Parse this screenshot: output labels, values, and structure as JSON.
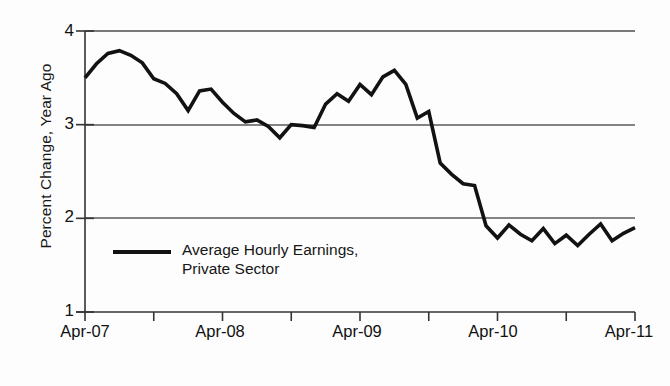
{
  "chart_data": {
    "type": "line",
    "title": "",
    "subtitle": "",
    "xlabel": "",
    "ylabel": "Percent Change, Year Ago",
    "ylim": [
      1,
      4
    ],
    "yticks": [
      1,
      2,
      3,
      4
    ],
    "ytick_labels": [
      "1",
      "2",
      "3",
      "4"
    ],
    "grid": "horizontal gridlines at 2, 3, and 4; baseline axis at 1",
    "gridlines_at": [
      2,
      3,
      4
    ],
    "xtick_labels": [
      "Apr-07",
      "Apr-08",
      "Apr-09",
      "Apr-10",
      "Apr-11"
    ],
    "xlim": [
      "Apr-07",
      "Apr-11"
    ],
    "xtick_interval_months": 6,
    "xlabel_interval_months": 12,
    "legend_position": "inside lower left",
    "series": [
      {
        "name": "Average Hourly Earnings, Private Sector",
        "color": "#121212",
        "x": [
          "Apr-07",
          "May-07",
          "Jun-07",
          "Jul-07",
          "Aug-07",
          "Sep-07",
          "Oct-07",
          "Nov-07",
          "Dec-07",
          "Jan-08",
          "Feb-08",
          "Mar-08",
          "Apr-08",
          "May-08",
          "Jun-08",
          "Jul-08",
          "Aug-08",
          "Sep-08",
          "Oct-08",
          "Nov-08",
          "Dec-08",
          "Jan-09",
          "Feb-09",
          "Mar-09",
          "Apr-09",
          "May-09",
          "Jun-09",
          "Jul-09",
          "Aug-09",
          "Sep-09",
          "Oct-09",
          "Nov-09",
          "Dec-09",
          "Jan-10",
          "Feb-10",
          "Mar-10",
          "Apr-10",
          "May-10",
          "Jun-10",
          "Jul-10",
          "Aug-10",
          "Sep-10",
          "Oct-10",
          "Nov-10",
          "Dec-10",
          "Jan-11",
          "Feb-11",
          "Mar-11",
          "Apr-11"
        ],
        "values": [
          3.5,
          3.65,
          3.76,
          3.79,
          3.74,
          3.66,
          3.49,
          3.44,
          3.33,
          3.15,
          3.36,
          3.38,
          3.24,
          3.12,
          3.03,
          3.05,
          2.98,
          2.86,
          3.0,
          2.99,
          2.97,
          3.22,
          3.33,
          3.25,
          3.43,
          3.32,
          3.51,
          3.58,
          3.43,
          3.07,
          3.14,
          2.59,
          2.47,
          2.37,
          2.35,
          1.92,
          1.79,
          1.93,
          1.83,
          1.76,
          1.89,
          1.73,
          1.82,
          1.71,
          1.83,
          1.94,
          1.76,
          1.84,
          1.9
        ]
      }
    ],
    "annotations": []
  },
  "axis": {
    "y_label": "Percent Change, Year Ago",
    "y_ticks": [
      "4",
      "3",
      "2",
      "1"
    ],
    "x_ticks": [
      "Apr-07",
      "Apr-08",
      "Apr-09",
      "Apr-10",
      "Apr-11"
    ]
  },
  "legend": {
    "line1": "Average Hourly Earnings,",
    "line2": "Private Sector",
    "swatch": "line-swatch"
  },
  "colors": {
    "line": "#121212",
    "grid": "#5a5a5a",
    "axis": "#333333",
    "background": "#fdfdfd",
    "text": "#161616"
  }
}
